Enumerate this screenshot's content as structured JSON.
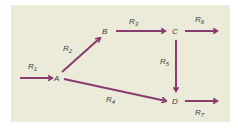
{
  "diagram": {
    "type": "reaction-network",
    "background_color": "#ecebd9",
    "arrow_color": "#8b3a6e",
    "nodes": [
      {
        "id": "A",
        "label": "A",
        "x": 57,
        "y": 80
      },
      {
        "id": "B",
        "label": "B",
        "x": 104,
        "y": 35
      },
      {
        "id": "C",
        "label": "C",
        "x": 173,
        "y": 34
      },
      {
        "id": "D",
        "label": "D",
        "x": 173,
        "y": 104
      }
    ],
    "edges": [
      {
        "id": "R1",
        "base": "R",
        "sub": "1",
        "from": "source",
        "to": "A"
      },
      {
        "id": "R2",
        "base": "R",
        "sub": "2",
        "from": "A",
        "to": "B"
      },
      {
        "id": "R3",
        "base": "R",
        "sub": "3",
        "from": "B",
        "to": "C"
      },
      {
        "id": "R4",
        "base": "R",
        "sub": "4",
        "from": "A",
        "to": "D"
      },
      {
        "id": "R5",
        "base": "R",
        "sub": "5",
        "from": "C",
        "to": "D"
      },
      {
        "id": "R6",
        "base": "R",
        "sub": "6",
        "from": "C",
        "to": "sink"
      },
      {
        "id": "R7",
        "base": "R",
        "sub": "7",
        "from": "D",
        "to": "sink"
      }
    ]
  }
}
